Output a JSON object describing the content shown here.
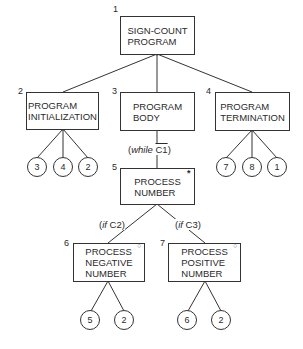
{
  "diagram": {
    "type": "structure chart",
    "nodes": [
      {
        "id": "1",
        "number": "1",
        "line1": "SIGN-COUNT",
        "line2": "PROGRAM",
        "line3": ""
      },
      {
        "id": "2",
        "number": "2",
        "line1": "PROGRAM",
        "line2": "INITIALIZATION",
        "line3": ""
      },
      {
        "id": "3",
        "number": "3",
        "line1": "PROGRAM",
        "line2": "BODY",
        "line3": ""
      },
      {
        "id": "4",
        "number": "4",
        "line1": "PROGRAM",
        "line2": "TERMINATION",
        "line3": ""
      },
      {
        "id": "5",
        "number": "5",
        "line1": "PROCESS",
        "line2": "NUMBER",
        "line3": "",
        "marker": "*"
      },
      {
        "id": "6",
        "number": "6",
        "line1": "PROCESS",
        "line2": "NEGATIVE",
        "line3": "NUMBER",
        "marker": "○"
      },
      {
        "id": "7",
        "number": "7",
        "line1": "PROCESS",
        "line2": "POSITIVE",
        "line3": "NUMBER",
        "marker": "○"
      }
    ],
    "conditions": {
      "while_prefix": "(while ",
      "while_cond": "C1",
      "while_suffix": ")",
      "if_c2_prefix": "(if ",
      "if_c2_cond": "C2)",
      "if_c3_prefix": "(if ",
      "if_c3_cond": "C3)"
    },
    "operations": {
      "node2": [
        "3",
        "4",
        "2"
      ],
      "node4": [
        "7",
        "8",
        "1"
      ],
      "node6": [
        "5",
        "2"
      ],
      "node7": [
        "6",
        "2"
      ]
    }
  }
}
